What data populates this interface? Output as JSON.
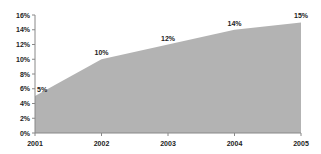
{
  "chart_data": {
    "type": "area",
    "title": "",
    "xlabel": "",
    "ylabel": "",
    "categories": [
      "2001",
      "2002",
      "2003",
      "2004",
      "2005"
    ],
    "values": [
      5,
      10,
      12,
      14,
      15
    ],
    "data_labels": [
      "5%",
      "10%",
      "12%",
      "14%",
      "15%"
    ],
    "ylim": [
      0,
      16
    ],
    "y_ticks": [
      "0%",
      "2%",
      "4%",
      "6%",
      "8%",
      "10%",
      "12%",
      "14%",
      "16%"
    ],
    "y_tick_values": [
      0,
      2,
      4,
      6,
      8,
      10,
      12,
      14,
      16
    ],
    "grid": false,
    "legend": null,
    "colors": {
      "fill": "#b3b3b3",
      "axis": "#888888",
      "text": "#222222"
    }
  }
}
